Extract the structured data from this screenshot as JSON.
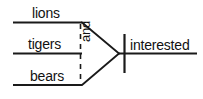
{
  "diagram": {
    "type": "reed-kellogg-sentence-diagram",
    "sentence": "Lions, tigers, and bears interested",
    "background_color": "#ffffff",
    "line_color": "#1a1a1a",
    "text_color": "#111111",
    "subject_branches": [
      {
        "id": "branch-lions",
        "word": "lions"
      },
      {
        "id": "branch-tigers",
        "word": "tigers"
      },
      {
        "id": "branch-bears",
        "word": "bears"
      }
    ],
    "conjunction": {
      "word": "and",
      "orientation": "vertical-rotated",
      "line_style": "dashed"
    },
    "predicate": {
      "word": "interested"
    },
    "divider": {
      "name": "subject-predicate-divider",
      "style": "solid-vertical"
    }
  }
}
